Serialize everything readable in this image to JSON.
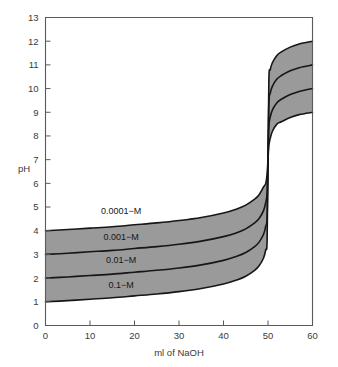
{
  "chart_data": {
    "type": "line",
    "title": "",
    "subtitle": "",
    "xlabel": "ml of NaOH",
    "ylabel": "pH",
    "xlim": [
      0,
      60
    ],
    "ylim": [
      0,
      13
    ],
    "grid": false,
    "legend_position": "inline-annotations",
    "xticks": [
      0,
      10,
      20,
      30,
      40,
      50,
      60
    ],
    "xtick_labels": [
      "0",
      "10",
      "20",
      "30",
      "40",
      "50",
      "60"
    ],
    "yticks": [
      0,
      1,
      2,
      3,
      4,
      5,
      6,
      7,
      8,
      9,
      10,
      11,
      12,
      13
    ],
    "ytick_labels": [
      "0",
      "1",
      "2",
      "3",
      "4",
      "5",
      "6",
      "7",
      "8",
      "9",
      "10",
      "11",
      "12",
      "13"
    ],
    "shaded_between_series": true,
    "shade_color": "#9a9a9a",
    "line_color": "#161616",
    "x": [
      0,
      5,
      10,
      15,
      20,
      25,
      30,
      35,
      40,
      43,
      45,
      47,
      48,
      49,
      49.5,
      49.8,
      50,
      50.2,
      50.5,
      51,
      52,
      53,
      55,
      57,
      60
    ],
    "series": [
      {
        "name": "0.1-M",
        "label": "0.1−M",
        "values": [
          1.0,
          1.05,
          1.11,
          1.17,
          1.25,
          1.33,
          1.43,
          1.56,
          1.75,
          1.92,
          2.08,
          2.33,
          2.52,
          2.85,
          3.2,
          3.6,
          7.0,
          10.4,
          10.8,
          11.1,
          11.4,
          11.55,
          11.75,
          11.88,
          12.0
        ]
      },
      {
        "name": "0.01-M",
        "label": "0.01−M",
        "values": [
          2.0,
          2.05,
          2.11,
          2.17,
          2.25,
          2.33,
          2.43,
          2.56,
          2.75,
          2.92,
          3.08,
          3.33,
          3.52,
          3.85,
          4.2,
          4.6,
          7.0,
          9.4,
          9.8,
          10.1,
          10.4,
          10.55,
          10.75,
          10.88,
          11.0
        ]
      },
      {
        "name": "0.001-M",
        "label": "0.001−M",
        "values": [
          3.0,
          3.05,
          3.11,
          3.17,
          3.25,
          3.33,
          3.43,
          3.56,
          3.75,
          3.92,
          4.08,
          4.33,
          4.52,
          4.85,
          5.2,
          5.6,
          7.0,
          8.4,
          8.8,
          9.1,
          9.4,
          9.55,
          9.75,
          9.88,
          10.0
        ]
      },
      {
        "name": "0.0001-M",
        "label": "0.0001−M",
        "values": [
          4.0,
          4.05,
          4.11,
          4.17,
          4.25,
          4.33,
          4.43,
          4.56,
          4.75,
          4.92,
          5.08,
          5.33,
          5.52,
          5.85,
          6.0,
          6.4,
          7.0,
          7.6,
          7.9,
          8.2,
          8.5,
          8.6,
          8.78,
          8.9,
          9.0
        ]
      }
    ],
    "annotations": [
      {
        "text": "0.0001−M",
        "x": 17,
        "y": 4.72
      },
      {
        "text": "0.001−M",
        "x": 17,
        "y": 3.6
      },
      {
        "text": "0.01−M",
        "x": 17,
        "y": 2.62
      },
      {
        "text": "0.1−M",
        "x": 17,
        "y": 1.6
      }
    ]
  },
  "axes": {
    "y_axis_title": "pH",
    "x_axis_title": "ml of NaOH"
  }
}
